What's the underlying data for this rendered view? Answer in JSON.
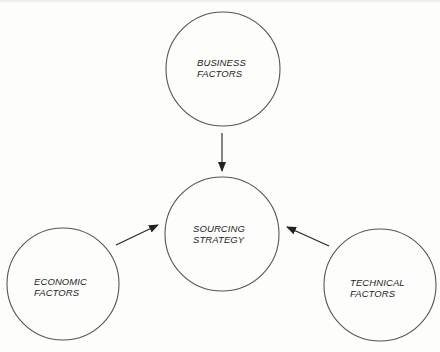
{
  "diagram": {
    "type": "influence-diagram",
    "colors": {
      "background": "#fdfdfb",
      "stroke": "#555555",
      "arrow": "#222222",
      "text": "#1e1e1e"
    },
    "nodes": [
      {
        "id": "business",
        "line1": "BUSINESS",
        "line2": "FACTORS",
        "cx": 223,
        "cy": 69,
        "r": 57,
        "label_x": 197,
        "label_y": 57
      },
      {
        "id": "sourcing",
        "line1": "SOURCING",
        "line2": "STRATEGY",
        "cx": 222,
        "cy": 234,
        "r": 57,
        "label_x": 193,
        "label_y": 223
      },
      {
        "id": "economic",
        "line1": "ECONOMIC",
        "line2": "FACTORS",
        "cx": 63,
        "cy": 284,
        "r": 56,
        "label_x": 34,
        "label_y": 276
      },
      {
        "id": "technical",
        "line1": "TECHNICAL",
        "line2": "FACTORS",
        "cx": 380,
        "cy": 285,
        "r": 56,
        "label_x": 350,
        "label_y": 277
      }
    ],
    "edges": [
      {
        "from": "business",
        "to": "sourcing",
        "x1": 222,
        "y1": 133,
        "x2": 222,
        "y2": 171
      },
      {
        "from": "economic",
        "to": "sourcing",
        "x1": 116,
        "y1": 245,
        "x2": 158,
        "y2": 225
      },
      {
        "from": "technical",
        "to": "sourcing",
        "x1": 329,
        "y1": 246,
        "x2": 287,
        "y2": 227
      }
    ]
  }
}
